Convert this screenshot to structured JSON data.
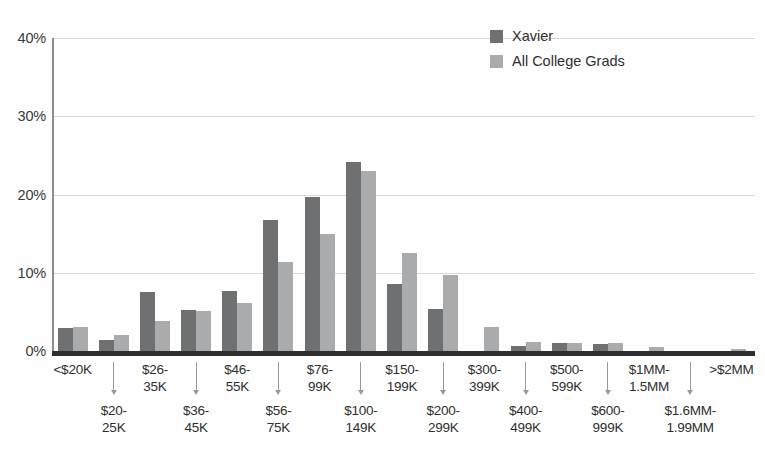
{
  "chart_data": {
    "type": "bar",
    "title": "",
    "xlabel": "",
    "ylabel": "",
    "ylim": [
      0,
      40
    ],
    "grid": true,
    "legend_position": "top-right",
    "ytick_labels": [
      "40%",
      "30%",
      "20%",
      "10%",
      "0%"
    ],
    "ytick_values": [
      40,
      30,
      20,
      10,
      0
    ],
    "categories": [
      "<$20K",
      "$20-\n25K",
      "$26-\n35K",
      "$36-\n45K",
      "$46-\n55K",
      "$56-\n75K",
      "$76-\n99K",
      "$100-\n149K",
      "$150-\n199K",
      "$200-\n299K",
      "$300-\n399K",
      "$400-\n499K",
      "$500-\n599K",
      "$600-\n999K",
      "$1MM-\n1.5MM",
      "$1.6MM-\n1.99MM",
      ">$2MM"
    ],
    "series": [
      {
        "name": "Xavier",
        "color": "#6f7071",
        "values": [
          3.0,
          1.4,
          7.6,
          5.3,
          7.7,
          16.7,
          19.7,
          24.1,
          8.6,
          5.4,
          0.0,
          0.6,
          1.0,
          0.9,
          0.0,
          0.0,
          0.0
        ]
      },
      {
        "name": "All College Grads",
        "color": "#a9abac",
        "values": [
          3.1,
          2.0,
          3.8,
          5.1,
          6.1,
          11.4,
          14.9,
          23.0,
          12.5,
          9.7,
          3.1,
          1.2,
          1.0,
          1.0,
          0.5,
          0.0,
          0.3
        ]
      }
    ]
  },
  "legend": {
    "items": [
      {
        "label": "Xavier",
        "swatch": "dark-gray-swatch"
      },
      {
        "label": "All College Grads",
        "swatch": "light-gray-swatch"
      }
    ]
  }
}
